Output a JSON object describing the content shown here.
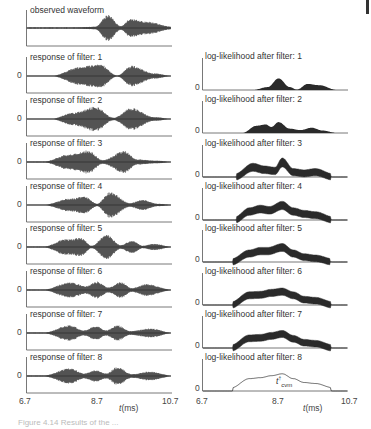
{
  "chart_data": [
    {
      "type": "area",
      "column": "left",
      "title": "Filter bank responses",
      "xlabel": "t(ms)",
      "xlim": [
        6.7,
        10.7
      ],
      "xticks": [
        "6.7",
        "8.7",
        "10.7"
      ],
      "yticks": [
        "0"
      ],
      "grid": false,
      "panels": [
        {
          "title": "observed waveform",
          "envelope": [
            [
              7.0,
              0.03
            ],
            [
              8.0,
              0.05
            ],
            [
              8.6,
              0.1
            ],
            [
              8.95,
              1.0
            ],
            [
              9.3,
              0.15
            ],
            [
              9.55,
              0.7
            ],
            [
              10.0,
              0.5
            ],
            [
              10.7,
              0.1
            ]
          ]
        },
        {
          "title": "response of filter: 1",
          "envelope": [
            [
              7.4,
              0.02
            ],
            [
              8.2,
              0.7
            ],
            [
              8.7,
              0.95
            ],
            [
              9.2,
              0.05
            ],
            [
              9.6,
              0.8
            ],
            [
              10.2,
              0.2
            ],
            [
              10.7,
              0.02
            ]
          ]
        },
        {
          "title": "response of filter: 2",
          "envelope": [
            [
              7.4,
              0.02
            ],
            [
              8.0,
              0.5
            ],
            [
              8.6,
              0.95
            ],
            [
              9.1,
              0.1
            ],
            [
              9.6,
              0.85
            ],
            [
              10.2,
              0.15
            ],
            [
              10.7,
              0.02
            ]
          ]
        },
        {
          "title": "response of filter: 3",
          "envelope": [
            [
              7.2,
              0.05
            ],
            [
              7.9,
              0.6
            ],
            [
              8.4,
              0.9
            ],
            [
              8.8,
              0.15
            ],
            [
              9.4,
              0.85
            ],
            [
              9.75,
              0.2
            ],
            [
              10.3,
              0.1
            ],
            [
              10.7,
              0.03
            ]
          ]
        },
        {
          "title": "response of filter: 4",
          "envelope": [
            [
              7.2,
              0.03
            ],
            [
              7.9,
              0.5
            ],
            [
              8.3,
              0.65
            ],
            [
              8.65,
              0.1
            ],
            [
              9.0,
              1.0
            ],
            [
              9.55,
              0.15
            ],
            [
              9.9,
              0.4
            ],
            [
              10.3,
              0.1
            ],
            [
              10.7,
              0.03
            ]
          ]
        },
        {
          "title": "response of filter: 5",
          "envelope": [
            [
              7.2,
              0.05
            ],
            [
              7.8,
              0.6
            ],
            [
              8.2,
              0.7
            ],
            [
              8.5,
              0.1
            ],
            [
              8.9,
              0.95
            ],
            [
              9.3,
              0.15
            ],
            [
              9.6,
              0.5
            ],
            [
              9.9,
              0.1
            ],
            [
              10.2,
              0.25
            ],
            [
              10.7,
              0.03
            ]
          ]
        },
        {
          "title": "response of filter: 6",
          "envelope": [
            [
              7.2,
              0.05
            ],
            [
              7.9,
              0.6
            ],
            [
              8.35,
              0.3
            ],
            [
              8.65,
              0.65
            ],
            [
              8.95,
              0.2
            ],
            [
              9.3,
              0.6
            ],
            [
              9.6,
              0.15
            ],
            [
              10.0,
              0.45
            ],
            [
              10.7,
              0.03
            ]
          ]
        },
        {
          "title": "response of filter: 7",
          "envelope": [
            [
              7.2,
              0.05
            ],
            [
              7.9,
              0.6
            ],
            [
              8.3,
              0.2
            ],
            [
              8.6,
              0.55
            ],
            [
              8.9,
              0.2
            ],
            [
              9.2,
              0.6
            ],
            [
              9.55,
              0.15
            ],
            [
              10.1,
              0.35
            ],
            [
              10.7,
              0.03
            ]
          ]
        },
        {
          "title": "response of filter: 8",
          "envelope": [
            [
              7.2,
              0.05
            ],
            [
              7.9,
              0.6
            ],
            [
              8.3,
              0.2
            ],
            [
              8.6,
              0.45
            ],
            [
              8.9,
              0.2
            ],
            [
              9.2,
              0.7
            ],
            [
              9.6,
              0.15
            ],
            [
              10.1,
              0.35
            ],
            [
              10.7,
              0.03
            ]
          ]
        }
      ]
    },
    {
      "type": "area",
      "column": "right",
      "title": "Log-likelihood after each filter",
      "xlabel": "t(ms)",
      "xlim": [
        6.7,
        10.7
      ],
      "xticks": [
        "6.7",
        "8.7",
        "10.7"
      ],
      "yticks": [
        "0"
      ],
      "grid": false,
      "annotation": {
        "text": "t_cvm",
        "x": 8.7,
        "panel": 8
      },
      "panels": [
        {
          "title": "log-likelihood after filter: 1",
          "curve": [
            [
              6.7,
              0
            ],
            [
              8.1,
              0
            ],
            [
              8.5,
              0.12
            ],
            [
              8.8,
              0.48
            ],
            [
              9.1,
              0.12
            ],
            [
              9.3,
              0.02
            ],
            [
              9.6,
              0.25
            ],
            [
              9.9,
              0.2
            ],
            [
              10.4,
              0
            ],
            [
              10.7,
              0
            ]
          ],
          "width": [
            [
              8.8,
              0.48
            ],
            [
              9.6,
              0.25
            ]
          ]
        },
        {
          "title": "log-likelihood after filter: 2",
          "curve": [
            [
              6.7,
              0
            ],
            [
              7.8,
              0
            ],
            [
              8.2,
              0.3
            ],
            [
              8.45,
              0.35
            ],
            [
              8.6,
              0.25
            ],
            [
              8.8,
              0.45
            ],
            [
              9.1,
              0.18
            ],
            [
              9.4,
              0.12
            ],
            [
              9.7,
              0.22
            ],
            [
              10.0,
              0.1
            ],
            [
              10.4,
              0
            ],
            [
              10.7,
              0
            ]
          ]
        },
        {
          "title": "log-likelihood after filter: 3",
          "curve": [
            [
              6.7,
              0
            ],
            [
              7.6,
              0
            ],
            [
              8.1,
              0.4
            ],
            [
              8.4,
              0.3
            ],
            [
              8.7,
              0.25
            ],
            [
              8.9,
              0.6
            ],
            [
              9.2,
              0.2
            ],
            [
              9.5,
              0.15
            ],
            [
              9.8,
              0.2
            ],
            [
              10.3,
              0
            ],
            [
              10.7,
              0
            ]
          ]
        },
        {
          "title": "log-likelihood after filter: 4",
          "curve": [
            [
              6.7,
              0
            ],
            [
              7.6,
              0
            ],
            [
              8.0,
              0.35
            ],
            [
              8.3,
              0.45
            ],
            [
              8.55,
              0.4
            ],
            [
              8.9,
              0.6
            ],
            [
              9.2,
              0.35
            ],
            [
              9.5,
              0.25
            ],
            [
              9.8,
              0.2
            ],
            [
              10.3,
              0
            ],
            [
              10.7,
              0
            ]
          ]
        },
        {
          "title": "log-likelihood after filter: 5",
          "curve": [
            [
              6.7,
              0
            ],
            [
              7.5,
              0
            ],
            [
              8.0,
              0.35
            ],
            [
              8.3,
              0.45
            ],
            [
              8.5,
              0.45
            ],
            [
              8.9,
              0.6
            ],
            [
              9.2,
              0.35
            ],
            [
              9.5,
              0.2
            ],
            [
              9.8,
              0.15
            ],
            [
              10.3,
              0
            ],
            [
              10.7,
              0
            ]
          ]
        },
        {
          "title": "log-likelihood after filter: 6",
          "curve": [
            [
              6.7,
              0
            ],
            [
              7.5,
              0
            ],
            [
              8.0,
              0.4
            ],
            [
              8.3,
              0.42
            ],
            [
              8.6,
              0.5
            ],
            [
              8.9,
              0.55
            ],
            [
              9.2,
              0.4
            ],
            [
              9.5,
              0.22
            ],
            [
              9.8,
              0.18
            ],
            [
              10.3,
              0
            ],
            [
              10.7,
              0
            ]
          ]
        },
        {
          "title": "log-likelihood after filter: 7",
          "curve": [
            [
              6.7,
              0
            ],
            [
              7.5,
              0
            ],
            [
              8.0,
              0.4
            ],
            [
              8.3,
              0.42
            ],
            [
              8.6,
              0.5
            ],
            [
              8.9,
              0.58
            ],
            [
              9.2,
              0.38
            ],
            [
              9.5,
              0.22
            ],
            [
              9.8,
              0.18
            ],
            [
              10.3,
              0
            ],
            [
              10.7,
              0
            ]
          ]
        },
        {
          "title": "log-likelihood after filter: 8",
          "curve": [
            [
              6.7,
              0
            ],
            [
              7.5,
              0
            ],
            [
              8.0,
              0.38
            ],
            [
              8.3,
              0.42
            ],
            [
              8.6,
              0.5
            ],
            [
              8.9,
              0.58
            ],
            [
              9.2,
              0.38
            ],
            [
              9.5,
              0.22
            ],
            [
              9.8,
              0.18
            ],
            [
              10.3,
              0
            ],
            [
              10.7,
              0
            ]
          ]
        }
      ]
    }
  ],
  "labels": {
    "zero": "0",
    "x_tick_min": "6.7",
    "x_tick_mid": "8.7",
    "x_tick_max": "10.7",
    "x_axis": "t(ms)",
    "annotation": "t",
    "annotation_sub": "cvm",
    "annotation_sup": "†",
    "caption": "Figure 4.14 Results of the ..."
  },
  "colors": {
    "ink": "#2a2a2a",
    "axis": "#555555",
    "text": "#333333"
  }
}
